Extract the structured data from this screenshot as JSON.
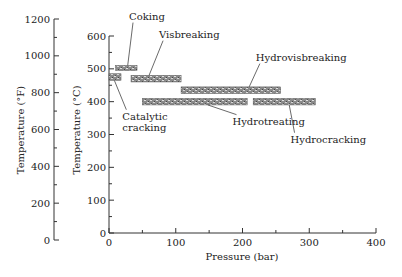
{
  "chart_data": {
    "type": "range-bar",
    "title": "",
    "xlabel": "Pressure (bar)",
    "ylabel": "Temperature (°C)",
    "ylabel_secondary": "Temperature (°F)",
    "xlim": [
      0,
      400
    ],
    "ylim": [
      0,
      600
    ],
    "ylim_secondary": [
      0,
      1200
    ],
    "x_ticks": [
      0,
      100,
      200,
      300,
      400
    ],
    "x_minor_ticks": [
      50,
      150,
      250,
      350
    ],
    "y_ticks": [
      0,
      100,
      200,
      300,
      400,
      500,
      600
    ],
    "y_minor_ticks": [
      50,
      150,
      250,
      350,
      450,
      550
    ],
    "y_secondary_ticks": [
      0,
      200,
      400,
      600,
      800,
      1000,
      1200
    ],
    "y_secondary_minor_ticks": [
      100,
      300,
      500,
      700,
      900,
      1100
    ],
    "grid": false,
    "legend": "none",
    "series": [
      {
        "name": "Coking",
        "pressure": [
          10,
          42
        ],
        "temperature": [
          495,
          510
        ],
        "label_pos": [
          30,
          650
        ],
        "leader_to": [
          28,
          510
        ]
      },
      {
        "name": "Catalytic cracking",
        "pressure": [
          0,
          18
        ],
        "temperature": [
          465,
          485
        ],
        "label_pos": [
          20,
          345
        ],
        "leader_to": [
          8,
          465
        ]
      },
      {
        "name": "Visbreaking",
        "pressure": [
          33,
          108
        ],
        "temperature": [
          460,
          480
        ],
        "label_pos": [
          75,
          595
        ],
        "leader_to": [
          60,
          480
        ]
      },
      {
        "name": "Hydrovisbreaking",
        "pressure": [
          108,
          257
        ],
        "temperature": [
          425,
          445
        ],
        "label_pos": [
          220,
          525
        ],
        "leader_to": [
          210,
          445
        ]
      },
      {
        "name": "Hydrotreating",
        "pressure": [
          50,
          207
        ],
        "temperature": [
          390,
          410
        ],
        "label_pos": [
          185,
          330
        ],
        "leader_to": [
          148,
          390
        ]
      },
      {
        "name": "Hydrocracking",
        "pressure": [
          216,
          309
        ],
        "temperature": [
          390,
          410
        ],
        "label_pos": [
          272,
          275
        ],
        "leader_to": [
          270,
          390
        ]
      }
    ]
  },
  "labels": {
    "xlabel": "Pressure (bar)",
    "ylabel_c": "Temperature (°C)",
    "ylabel_f": "Temperature (°F)"
  }
}
